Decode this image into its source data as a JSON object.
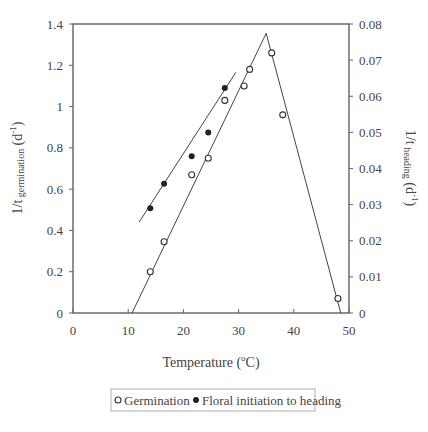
{
  "chart_data": {
    "type": "scatter",
    "title": "",
    "xlabel": "Temperature (°C)",
    "xlabel_parts": {
      "prefix": "Temperature (",
      "sup": "o",
      "suffix": "C)"
    },
    "ylabel_left": "1/t germination (d-1)",
    "ylabel_left_parts": {
      "main": "1/t",
      "sub": " germination",
      "open": " (d",
      "sup": "-1",
      "close": ")"
    },
    "ylabel_right": "1/t heading (d-1)",
    "ylabel_right_parts": {
      "main": "1/t",
      "sub": " heading",
      "open": " (d",
      "sup": "-1",
      "close": ")"
    },
    "xlim": [
      0,
      50
    ],
    "ylim_left": [
      0,
      1.4
    ],
    "ylim_right": [
      0,
      0.08
    ],
    "x_ticks": [
      "0",
      "10",
      "20",
      "30",
      "40",
      "50"
    ],
    "y_left_ticks": [
      "0",
      "0.2",
      "0.4",
      "0.6",
      "0.8",
      "1",
      "1.2",
      "1.4"
    ],
    "y_right_ticks": [
      "0",
      "0.01",
      "0.02",
      "0.03",
      "0.04",
      "0.05",
      "0.06",
      "0.07",
      "0.08"
    ],
    "grid": false,
    "legend_position": "bottom",
    "series": [
      {
        "name": "Germination",
        "marker": "open-circle",
        "axis": "left",
        "x": [
          14,
          16.5,
          21.5,
          24.5,
          27.5,
          31,
          32,
          36,
          38,
          48
        ],
        "y": [
          0.2,
          0.345,
          0.67,
          0.75,
          1.03,
          1.1,
          1.18,
          1.26,
          0.96,
          0.07
        ]
      },
      {
        "name": "Floral initiation to heading",
        "marker": "filled-circle",
        "axis": "right",
        "x": [
          14,
          16.5,
          21.5,
          24.5,
          27.5
        ],
        "y": [
          0.029,
          0.0358,
          0.0434,
          0.05,
          0.0623
        ]
      }
    ],
    "fit_lines": [
      {
        "name": "germination-rising",
        "axis": "left",
        "points": [
          [
            10.7,
            0
          ],
          [
            35,
            1.355
          ]
        ]
      },
      {
        "name": "germination-falling",
        "axis": "left",
        "points": [
          [
            35,
            1.355
          ],
          [
            48.5,
            0
          ]
        ]
      },
      {
        "name": "heading-fit",
        "axis": "right",
        "points": [
          [
            12,
            0.0252
          ],
          [
            29.5,
            0.0666
          ]
        ]
      }
    ]
  }
}
